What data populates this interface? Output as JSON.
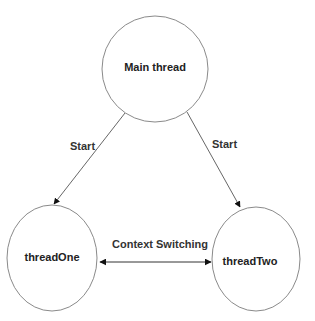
{
  "diagram": {
    "nodes": [
      {
        "id": "main",
        "label": "Main thread",
        "shape": "circle"
      },
      {
        "id": "threadOne",
        "label": "threadOne",
        "shape": "ellipse"
      },
      {
        "id": "threadTwo",
        "label": "threadTwo",
        "shape": "ellipse"
      }
    ],
    "edges": [
      {
        "from": "main",
        "to": "threadOne",
        "label": "Start",
        "direction": "forward"
      },
      {
        "from": "main",
        "to": "threadTwo",
        "label": "Start",
        "direction": "forward"
      },
      {
        "from": "threadOne",
        "to": "threadTwo",
        "label": "Context Switching",
        "direction": "both"
      }
    ]
  },
  "colors": {
    "node_stroke": "#8a8a8a",
    "edge_stroke": "#555555",
    "text": "#222222",
    "background": "#ffffff"
  }
}
